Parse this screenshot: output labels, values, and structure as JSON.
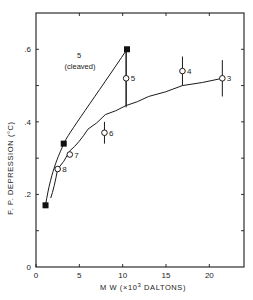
{
  "chart_data": {
    "type": "scatter",
    "title": "",
    "xlabel": "M W (×10³ DALTONS)",
    "ylabel": "F. P. DEPRESSION (°C)",
    "xlim": [
      0,
      24
    ],
    "ylim": [
      0,
      0.7
    ],
    "x_ticks": [
      0,
      5,
      10,
      15,
      20
    ],
    "x_tick_labels": [
      "0",
      "5",
      "10",
      "15",
      "20"
    ],
    "y_ticks": [
      0,
      0.1,
      0.2,
      0.3,
      0.4,
      0.5,
      0.6
    ],
    "y_tick_labels": [
      "0",
      "",
      ".2",
      "",
      ".4",
      "",
      ".6"
    ],
    "grid": false,
    "legend": null,
    "series": [
      {
        "name": "5 (cleaved)",
        "marker": "filled-square",
        "line": "fitted curve",
        "points": [
          {
            "x": 1.1,
            "y": 0.17
          },
          {
            "x": 3.2,
            "y": 0.34
          },
          {
            "x": 10.5,
            "y": 0.6
          }
        ]
      },
      {
        "name": "intact",
        "marker": "open-circle",
        "line": "fitted curve",
        "points": [
          {
            "x": 2.5,
            "y": 0.27,
            "label": "8",
            "err": 0
          },
          {
            "x": 3.9,
            "y": 0.31,
            "label": "7",
            "err": 0
          },
          {
            "x": 7.9,
            "y": 0.37,
            "label": "6",
            "err": 0.03
          },
          {
            "x": 10.4,
            "y": 0.52,
            "label": "5",
            "err": 0.08
          },
          {
            "x": 16.9,
            "y": 0.54,
            "label": "4",
            "err": 0.04
          },
          {
            "x": 21.5,
            "y": 0.52,
            "label": "3",
            "err": 0.05
          }
        ]
      }
    ],
    "annotations": [
      {
        "text": "5",
        "x": 5.0,
        "y": 0.56
      },
      {
        "text": "(cleaved)",
        "x": 5.0,
        "y": 0.52
      }
    ]
  },
  "labels": {
    "x_axis_prefix": "M W  (×10",
    "x_axis_sup": "3",
    "x_axis_suffix": " DALTONS)",
    "y_axis": "F. P.  DEPRESSION   (°C)",
    "anno_line1": "5",
    "anno_line2": "(cleaved)"
  }
}
